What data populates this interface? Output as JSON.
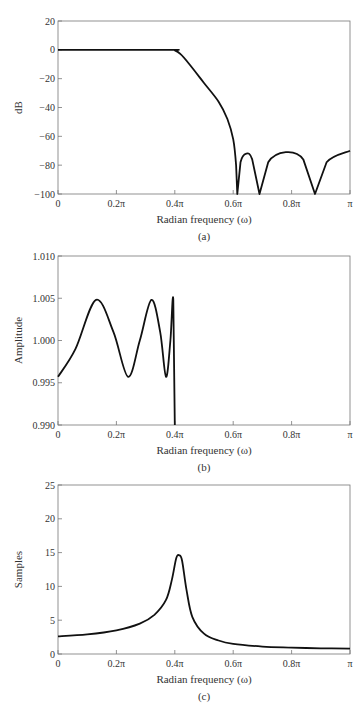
{
  "chart_data": [
    {
      "id": "a",
      "type": "line",
      "caption": "(a)",
      "xlabel": "Radian frequency (ω)",
      "ylabel": "dB",
      "xlim": [
        0,
        1
      ],
      "ylim": [
        -100,
        20
      ],
      "xticks": [
        "0",
        "0.2π",
        "0.4π",
        "0.6π",
        "0.8π",
        "π"
      ],
      "yticks": [
        "20",
        "0",
        "−20",
        "−40",
        "−60",
        "−80",
        "−100"
      ],
      "grid": false,
      "series": [
        {
          "name": "magnitude (dB)",
          "x_units": "fraction of π",
          "points": [
            [
              0,
              0
            ],
            [
              0.38,
              0
            ],
            [
              0.4,
              -0.3
            ],
            [
              0.42,
              -3
            ],
            [
              0.45,
              -10
            ],
            [
              0.5,
              -23
            ],
            [
              0.55,
              -36
            ],
            [
              0.58,
              -48
            ],
            [
              0.6,
              -62
            ],
            [
              0.61,
              -80
            ],
            [
              0.614,
              -100
            ],
            [
              0.625,
              -78
            ],
            [
              0.645,
              -72
            ],
            [
              0.665,
              -76
            ],
            [
              0.69,
              -100
            ],
            [
              0.72,
              -78
            ],
            [
              0.78,
              -71
            ],
            [
              0.84,
              -76
            ],
            [
              0.88,
              -100
            ],
            [
              0.92,
              -78
            ],
            [
              1.0,
              -70
            ]
          ]
        }
      ]
    },
    {
      "id": "b",
      "type": "line",
      "caption": "(b)",
      "xlabel": "Radian frequency (ω)",
      "ylabel": "Amplitude",
      "xlim": [
        0,
        1
      ],
      "ylim": [
        0.99,
        1.01
      ],
      "xticks": [
        "0",
        "0.2π",
        "0.4π",
        "0.6π",
        "0.8π",
        "π"
      ],
      "yticks": [
        "1.010",
        "1.005",
        "1.000",
        "0.995",
        "0.990"
      ],
      "grid": false,
      "series": [
        {
          "name": "passband amplitude",
          "x_units": "fraction of π",
          "points": [
            [
              0,
              0.9957
            ],
            [
              0.06,
              0.999
            ],
            [
              0.13,
              1.0048
            ],
            [
              0.19,
              1.001
            ],
            [
              0.24,
              0.9957
            ],
            [
              0.28,
              1.0
            ],
            [
              0.32,
              1.0048
            ],
            [
              0.35,
              1.001
            ],
            [
              0.37,
              0.9957
            ],
            [
              0.385,
              1.0
            ],
            [
              0.395,
              1.0048
            ],
            [
              0.4,
              0.99
            ]
          ]
        }
      ]
    },
    {
      "id": "c",
      "type": "line",
      "caption": "(c)",
      "xlabel": "Radian frequency (ω)",
      "ylabel": "Samples",
      "xlim": [
        0,
        1
      ],
      "ylim": [
        0,
        25
      ],
      "xticks": [
        "0",
        "0.2π",
        "0.4π",
        "0.6π",
        "0.8π",
        "π"
      ],
      "yticks": [
        "25",
        "20",
        "15",
        "10",
        "5",
        "0"
      ],
      "grid": false,
      "series": [
        {
          "name": "group delay",
          "x_units": "fraction of π",
          "points": [
            [
              0,
              2.6
            ],
            [
              0.1,
              2.9
            ],
            [
              0.2,
              3.5
            ],
            [
              0.28,
              4.5
            ],
            [
              0.33,
              5.8
            ],
            [
              0.37,
              8.0
            ],
            [
              0.39,
              11.0
            ],
            [
              0.405,
              14.2
            ],
            [
              0.415,
              14.6
            ],
            [
              0.425,
              13.8
            ],
            [
              0.44,
              9.5
            ],
            [
              0.46,
              5.5
            ],
            [
              0.5,
              3.0
            ],
            [
              0.55,
              2.0
            ],
            [
              0.6,
              1.5
            ],
            [
              0.7,
              1.1
            ],
            [
              0.8,
              0.95
            ],
            [
              0.9,
              0.85
            ],
            [
              1.0,
              0.8
            ]
          ]
        }
      ]
    }
  ]
}
